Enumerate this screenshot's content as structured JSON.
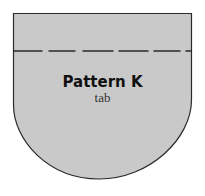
{
  "pattern": {
    "title": "Pattern K",
    "subtitle": "tab"
  },
  "colors": {
    "fill": "#c9c9c9",
    "outline": "#2a2a2a",
    "fold_line": "#2a2a2a",
    "background": "#ffffff"
  }
}
